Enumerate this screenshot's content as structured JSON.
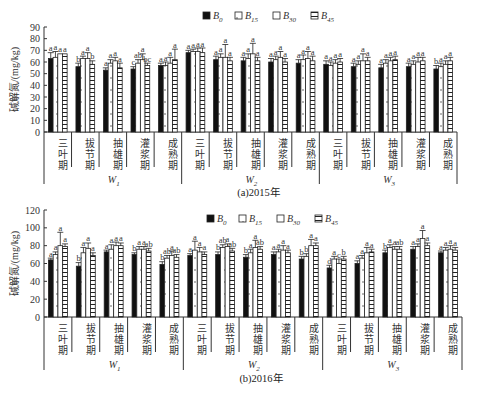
{
  "chart_data": [
    {
      "type": "bar",
      "title": "(a)2015年",
      "caption": "(a)2015年",
      "ylabel": "碱解氮/(mg/kg)",
      "xlabel": "",
      "ylim": [
        0,
        90
      ],
      "yticks": [
        0,
        10,
        20,
        30,
        40,
        50,
        60,
        70,
        80,
        90
      ],
      "grid": false,
      "legend_position": "top-center",
      "groups": [
        "W1",
        "W2",
        "W3"
      ],
      "group_labels": [
        {
          "main": "W",
          "sub": "1"
        },
        {
          "main": "W",
          "sub": "2"
        },
        {
          "main": "W",
          "sub": "3"
        }
      ],
      "stages": [
        "三叶期",
        "拔节期",
        "抽雄期",
        "灌浆期",
        "成熟期"
      ],
      "categories": [
        "W1-三叶期",
        "W1-拔节期",
        "W1-抽雄期",
        "W1-灌浆期",
        "W1-成熟期",
        "W2-三叶期",
        "W2-拔节期",
        "W2-抽雄期",
        "W2-灌浆期",
        "W2-成熟期",
        "W3-三叶期",
        "W3-拔节期",
        "W3-抽雄期",
        "W3-灌浆期",
        "W3-成熟期"
      ],
      "series": [
        {
          "name": "B0",
          "label_main": "B",
          "label_sub": "0",
          "pattern": "solid",
          "values": [
            63,
            56,
            53,
            54,
            57,
            68,
            62,
            61,
            60,
            59,
            58,
            56,
            55,
            56,
            54
          ],
          "errors": [
            5,
            3,
            2,
            2,
            2,
            2,
            3,
            3,
            3,
            3,
            3,
            3,
            3,
            3,
            3
          ],
          "letters": [
            "a",
            "b",
            "a",
            "c",
            "a",
            "a",
            "a",
            "a",
            "a",
            "a",
            "a",
            "a",
            "a",
            "a",
            "b"
          ]
        },
        {
          "name": "B15",
          "label_main": "B",
          "label_sub": "15",
          "pattern": "dotted",
          "values": [
            64,
            63,
            59,
            59,
            57,
            69,
            64,
            63,
            62,
            62,
            57,
            58,
            59,
            58,
            56
          ],
          "errors": [
            5,
            2,
            3,
            3,
            3,
            2,
            3,
            4,
            3,
            4,
            3,
            3,
            3,
            3,
            3
          ],
          "letters": [
            "a",
            "a",
            "a",
            "ab",
            "a",
            "a",
            "a",
            "a",
            "a",
            "a",
            "a",
            "a",
            "a",
            "a",
            "a"
          ]
        },
        {
          "name": "B30",
          "label_main": "B",
          "label_sub": "30",
          "pattern": "open",
          "values": [
            67,
            63,
            61,
            62,
            59,
            69,
            64,
            67,
            64,
            63,
            59,
            61,
            61,
            60,
            58
          ],
          "errors": [
            0,
            5,
            3,
            5,
            5,
            3,
            11,
            9,
            5,
            6,
            3,
            6,
            3,
            4,
            3
          ],
          "letters": [
            "a",
            "a",
            "a",
            "a",
            "a",
            "a",
            "a",
            "a",
            "a",
            "a",
            "a",
            "a",
            "a",
            "a",
            "a"
          ]
        },
        {
          "name": "B45",
          "label_main": "B",
          "label_sub": "45",
          "pattern": "striped",
          "values": [
            67,
            58,
            55,
            57,
            62,
            68,
            61,
            61,
            60,
            61,
            60,
            61,
            62,
            61,
            61
          ],
          "errors": [
            0,
            3,
            4,
            2,
            9,
            4,
            3,
            3,
            3,
            4,
            3,
            3,
            3,
            3,
            3
          ],
          "letters": [
            "a",
            "b",
            "a",
            "bc",
            "a",
            "a",
            "a",
            "a",
            "a",
            "a",
            "a",
            "a",
            "a",
            "a",
            "a"
          ]
        }
      ]
    },
    {
      "type": "bar",
      "title": "(b)2016年",
      "caption": "(b)2016年",
      "ylabel": "碱解氮/(mg/kg)",
      "xlabel": "",
      "ylim": [
        0,
        120
      ],
      "yticks": [
        0,
        20,
        40,
        60,
        80,
        100,
        120
      ],
      "grid": false,
      "legend_position": "top-right",
      "groups": [
        "W1",
        "W2",
        "W3"
      ],
      "group_labels": [
        {
          "main": "W",
          "sub": "1"
        },
        {
          "main": "W",
          "sub": "2"
        },
        {
          "main": "W",
          "sub": "3"
        }
      ],
      "stages": [
        "三叶期",
        "拔节期",
        "抽雄期",
        "灌浆期",
        "成熟期"
      ],
      "categories": [
        "W1-三叶期",
        "W1-拔节期",
        "W1-抽雄期",
        "W1-灌浆期",
        "W1-成熟期",
        "W2-三叶期",
        "W2-拔节期",
        "W2-抽雄期",
        "W2-灌浆期",
        "W2-成熟期",
        "W3-三叶期",
        "W3-拔节期",
        "W3-抽雄期",
        "W3-灌浆期",
        "W3-成熟期"
      ],
      "series": [
        {
          "name": "B0",
          "label_main": "B",
          "label_sub": "0",
          "pattern": "solid",
          "values": [
            64,
            57,
            73,
            70,
            59,
            69,
            70,
            67,
            70,
            65,
            55,
            60,
            72,
            76,
            72
          ],
          "errors": [
            2,
            4,
            2,
            2,
            3,
            2,
            3,
            3,
            3,
            3,
            3,
            3,
            3,
            3,
            2
          ],
          "letters": [
            "a",
            "b",
            "a",
            "b",
            "b",
            "a",
            "b",
            "b",
            "a",
            "b",
            "d",
            "a",
            "b",
            "a",
            "a"
          ]
        },
        {
          "name": "B15",
          "label_main": "B",
          "label_sub": "15",
          "pattern": "dotted",
          "values": [
            70,
            72,
            76,
            76,
            66,
            75,
            78,
            72,
            73,
            68,
            65,
            66,
            78,
            79,
            75
          ],
          "errors": [
            3,
            6,
            5,
            3,
            3,
            10,
            3,
            4,
            3,
            3,
            3,
            3,
            3,
            3,
            3
          ],
          "letters": [
            "a",
            "a",
            "a",
            "a",
            "ab",
            "a",
            "ab",
            "a",
            "a",
            "b",
            "a",
            "a",
            "a",
            "a",
            "a"
          ]
        },
        {
          "name": "B30",
          "label_main": "B",
          "label_sub": "30",
          "pattern": "open",
          "values": [
            80,
            77,
            80,
            76,
            69,
            73,
            79,
            78,
            75,
            80,
            60,
            72,
            76,
            88,
            76
          ],
          "errors": [
            15,
            6,
            4,
            3,
            5,
            5,
            3,
            8,
            5,
            7,
            5,
            6,
            3,
            9,
            4
          ],
          "letters": [
            "a",
            "a",
            "a",
            "a",
            "a",
            "a",
            "a",
            "a",
            "a",
            "a",
            "c",
            "a",
            "a",
            "a",
            "a"
          ]
        },
        {
          "name": "B45",
          "label_main": "B",
          "label_sub": "45",
          "pattern": "striped",
          "values": [
            79,
            69,
            80,
            74,
            67,
            70,
            74,
            76,
            72,
            80,
            65,
            73,
            76,
            80,
            75
          ],
          "errors": [
            3,
            3,
            3,
            3,
            3,
            3,
            3,
            3,
            3,
            3,
            3,
            3,
            3,
            3,
            3
          ],
          "letters": [
            "a",
            "a",
            "a",
            "ab",
            "ab",
            "a",
            "ab",
            "ab",
            "a",
            "a",
            "b",
            "a",
            "ab",
            "a",
            "a"
          ]
        }
      ]
    }
  ],
  "layout_colors": {
    "bar_solid": "#111111",
    "axis": "#333333",
    "bar_outline": "#222222"
  }
}
